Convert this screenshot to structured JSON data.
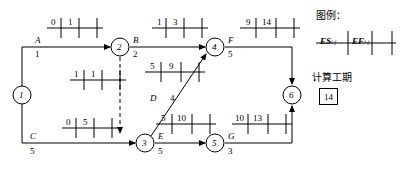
{
  "diagram": {
    "type": "cpm-network-double-code",
    "nodes": [
      {
        "id": "n1",
        "label": "1",
        "cx": 22,
        "cy": 95
      },
      {
        "id": "n2",
        "label": "2",
        "cx": 120,
        "cy": 47
      },
      {
        "id": "n3",
        "label": "3",
        "cx": 145,
        "cy": 143
      },
      {
        "id": "n4",
        "label": "4",
        "cx": 215,
        "cy": 47
      },
      {
        "id": "n5",
        "label": "5",
        "cx": 215,
        "cy": 143
      },
      {
        "id": "n6",
        "label": "6",
        "cx": 292,
        "cy": 95
      }
    ],
    "activities": [
      {
        "id": "A",
        "name": "A",
        "duration": "1",
        "from": "n1",
        "to": "n2",
        "es": "0",
        "ef": "1",
        "table_x": 47,
        "table_y": 28,
        "name_x": 35,
        "name_y": 41,
        "dur_x": 35,
        "dur_y": 55
      },
      {
        "id": "B",
        "name": "B",
        "duration": "2",
        "from": "n2",
        "to": "n4",
        "es": "1",
        "ef": "3",
        "table_x": 152,
        "table_y": 28,
        "name_x": 133,
        "name_y": 41,
        "dur_x": 133,
        "dur_y": 55
      },
      {
        "id": "C",
        "name": "C",
        "duration": "5",
        "from": "n1",
        "to": "n3",
        "es": "0",
        "ef": "5",
        "table_x": 62,
        "table_y": 128,
        "name_x": 30,
        "name_y": 137,
        "dur_x": 30,
        "dur_y": 152
      },
      {
        "id": "D",
        "name": "D",
        "duration": "4",
        "from": "n3",
        "to": "n4",
        "es": "5",
        "ef": "9",
        "table_x": 145,
        "table_y": 72,
        "name_x": 150,
        "name_y": 99,
        "dur_x": 168,
        "dur_y": 99
      },
      {
        "id": "E",
        "name": "E",
        "duration": "5",
        "from": "n3",
        "to": "n5",
        "es": "5",
        "ef": "10",
        "table_x": 156,
        "table_y": 124,
        "name_x": 158,
        "name_y": 137,
        "dur_x": 158,
        "dur_y": 152
      },
      {
        "id": "F",
        "name": "F",
        "duration": "5",
        "from": "n4",
        "to": "n6",
        "es": "9",
        "ef": "14",
        "table_x": 240,
        "table_y": 28,
        "name_x": 229,
        "name_y": 41,
        "dur_x": 229,
        "dur_y": 55
      },
      {
        "id": "G",
        "name": "G",
        "duration": "3",
        "from": "n5",
        "to": "n6",
        "es": "10",
        "ef": "13",
        "table_x": 232,
        "table_y": 124,
        "name_x": 228,
        "name_y": 137,
        "dur_x": 228,
        "dur_y": 152
      },
      {
        "id": "dummy",
        "name": "",
        "duration": "",
        "from": "n2",
        "to": "n3",
        "es": "1",
        "ef": "1",
        "table_x": 70,
        "table_y": 80,
        "name_x": 0,
        "name_y": 0,
        "dur_x": 0,
        "dur_y": 0
      }
    ],
    "legend": {
      "title": "图例：",
      "cell_es": "ES",
      "cell_es_sub": "i-j",
      "cell_ef": "EF",
      "cell_ef_sub": "i-j"
    },
    "duration_note": {
      "title": "计算工期",
      "value": "14"
    }
  }
}
